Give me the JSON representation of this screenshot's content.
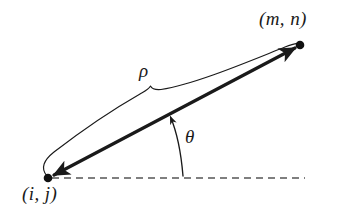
{
  "figure": {
    "type": "geometry-diagram",
    "background_color": "#ffffff",
    "stroke_color": "#1a1a1a",
    "width": 350,
    "height": 216,
    "labels": {
      "endpoint_start": "(i, j)",
      "endpoint_end": "(m, n)",
      "length_symbol": "ρ",
      "angle_symbol": "θ"
    },
    "elements": {
      "main_vector_name": "double-headed-arrow",
      "brace_name": "length-brace",
      "baseline_name": "horizontal-dashed-baseline",
      "angle_arc_name": "angle-arc"
    },
    "geometry": {
      "start_point": [
        48,
        178
      ],
      "end_point": [
        300,
        45
      ],
      "baseline_end": [
        305,
        178
      ],
      "brace_peak": [
        150,
        88
      ],
      "angle_arc_base": [
        183,
        178
      ],
      "angle_arc_tip": [
        168,
        113
      ],
      "dot_radius": 4.2,
      "main_line_width": 3.2,
      "thin_line_width": 1.1,
      "dash_pattern": "7 5"
    }
  }
}
